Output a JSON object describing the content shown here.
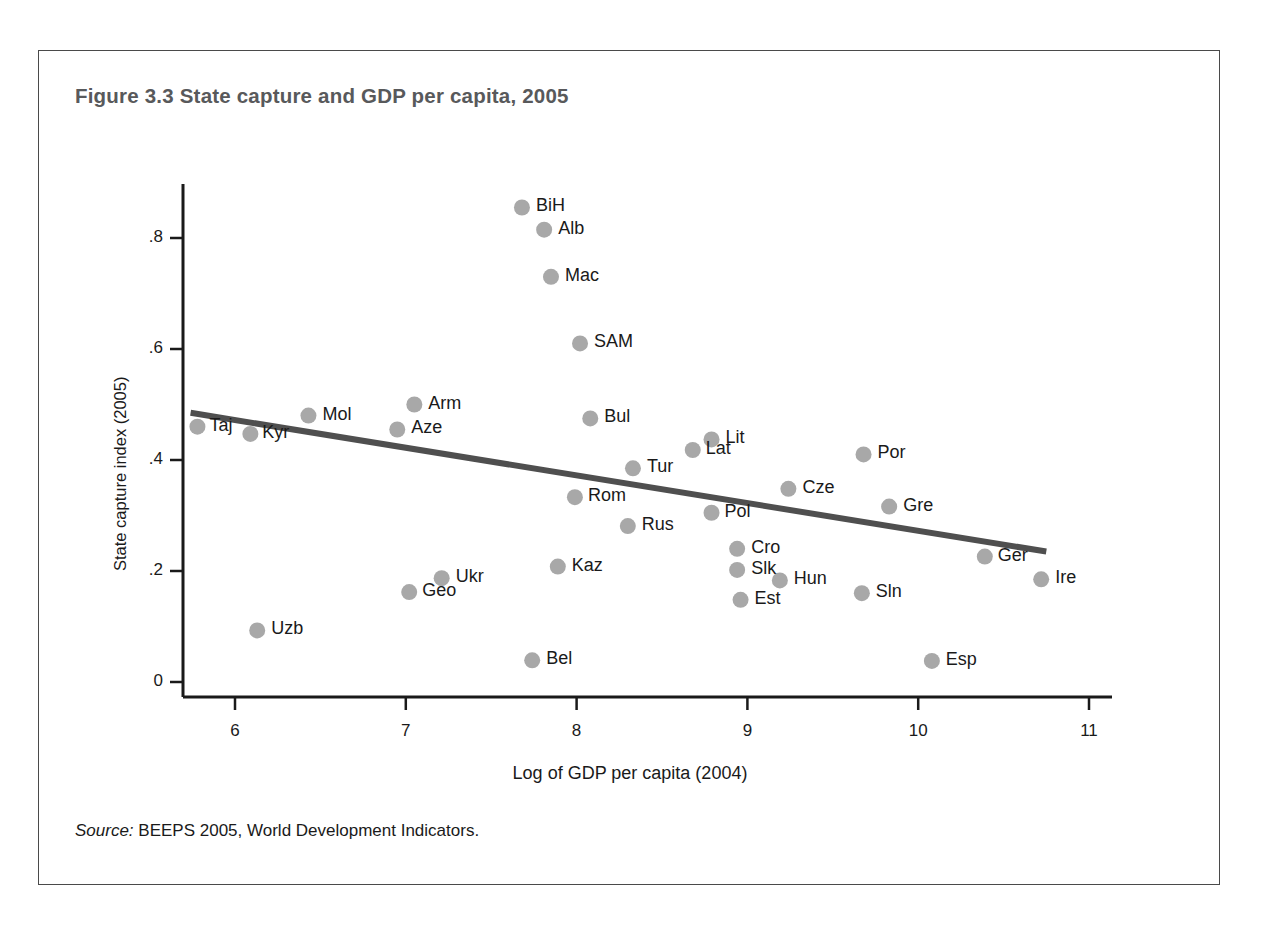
{
  "figure": {
    "title": "Figure 3.3  State capture and GDP per capita, 2005",
    "source_word": "Source:",
    "source_text": " BEEPS 2005, World Development Indicators."
  },
  "chart_data": {
    "type": "scatter",
    "title": "Figure 3.3  State capture and GDP per capita, 2005",
    "xlabel": "Log of GDP per capita (2004)",
    "ylabel": "State capture index (2005)",
    "xlim": [
      5.7,
      11.15
    ],
    "ylim": [
      -0.03,
      0.93
    ],
    "xticks": [
      6,
      7,
      8,
      9,
      10,
      11
    ],
    "xtick_labels": [
      "6",
      "7",
      "8",
      "9",
      "10",
      "11"
    ],
    "yticks": [
      0,
      0.2,
      0.4,
      0.6,
      0.8
    ],
    "ytick_labels": [
      "0",
      ".2",
      ".4",
      ".6",
      ".8"
    ],
    "grid": false,
    "legend": false,
    "marker_color": "#a8a8a8",
    "trendline_color": "#4f4f4f",
    "axis_color": "#1a1a1a",
    "trendline": {
      "x_start": 5.74,
      "y_start": 0.485,
      "x_end": 10.75,
      "y_end": 0.235
    },
    "points": [
      {
        "label": "BiH",
        "x": 7.68,
        "y": 0.855,
        "label_dx": 14,
        "label_dy": -9
      },
      {
        "label": "Alb",
        "x": 7.81,
        "y": 0.815,
        "label_dx": 14,
        "label_dy": -9
      },
      {
        "label": "Mac",
        "x": 7.85,
        "y": 0.73,
        "label_dx": 14,
        "label_dy": -9
      },
      {
        "label": "SAM",
        "x": 8.02,
        "y": 0.61,
        "label_dx": 14,
        "label_dy": -9
      },
      {
        "label": "Arm",
        "x": 7.05,
        "y": 0.5,
        "label_dx": 14,
        "label_dy": -9
      },
      {
        "label": "Mol",
        "x": 6.43,
        "y": 0.48,
        "label_dx": 14,
        "label_dy": -9
      },
      {
        "label": "Bul",
        "x": 8.08,
        "y": 0.475,
        "label_dx": 14,
        "label_dy": -9
      },
      {
        "label": "Taj",
        "x": 5.78,
        "y": 0.46,
        "label_dx": 12,
        "label_dy": -9
      },
      {
        "label": "Aze",
        "x": 6.95,
        "y": 0.455,
        "label_dx": 14,
        "label_dy": -9
      },
      {
        "label": "Kyr",
        "x": 6.09,
        "y": 0.447,
        "label_dx": 12,
        "label_dy": -9
      },
      {
        "label": "Lit",
        "x": 8.79,
        "y": 0.437,
        "label_dx": 14,
        "label_dy": -9
      },
      {
        "label": "Lat",
        "x": 8.68,
        "y": 0.418,
        "label_dx": 13,
        "label_dy": -9
      },
      {
        "label": "Por",
        "x": 9.68,
        "y": 0.41,
        "label_dx": 14,
        "label_dy": -9
      },
      {
        "label": "Tur",
        "x": 8.33,
        "y": 0.385,
        "label_dx": 14,
        "label_dy": -9
      },
      {
        "label": "Cze",
        "x": 9.24,
        "y": 0.348,
        "label_dx": 14,
        "label_dy": -9
      },
      {
        "label": "Rom",
        "x": 7.99,
        "y": 0.333,
        "label_dx": 13,
        "label_dy": -9
      },
      {
        "label": "Gre",
        "x": 9.83,
        "y": 0.316,
        "label_dx": 14,
        "label_dy": -9
      },
      {
        "label": "Pol",
        "x": 8.79,
        "y": 0.305,
        "label_dx": 13,
        "label_dy": -9
      },
      {
        "label": "Rus",
        "x": 8.3,
        "y": 0.281,
        "label_dx": 14,
        "label_dy": -9
      },
      {
        "label": "Cro",
        "x": 8.94,
        "y": 0.24,
        "label_dx": 14,
        "label_dy": -9
      },
      {
        "label": "Ger",
        "x": 10.39,
        "y": 0.226,
        "label_dx": 13,
        "label_dy": -9
      },
      {
        "label": "Kaz",
        "x": 7.89,
        "y": 0.208,
        "label_dx": 14,
        "label_dy": -9
      },
      {
        "label": "Slk",
        "x": 8.94,
        "y": 0.202,
        "label_dx": 14,
        "label_dy": -9
      },
      {
        "label": "Ire",
        "x": 10.72,
        "y": 0.185,
        "label_dx": 14,
        "label_dy": -9
      },
      {
        "label": "Ukr",
        "x": 7.21,
        "y": 0.187,
        "label_dx": 14,
        "label_dy": -9
      },
      {
        "label": "Hun",
        "x": 9.19,
        "y": 0.183,
        "label_dx": 14,
        "label_dy": -9
      },
      {
        "label": "Sln",
        "x": 9.67,
        "y": 0.16,
        "label_dx": 14,
        "label_dy": -9
      },
      {
        "label": "Geo",
        "x": 7.02,
        "y": 0.162,
        "label_dx": 13,
        "label_dy": -9
      },
      {
        "label": "Est",
        "x": 8.96,
        "y": 0.148,
        "label_dx": 14,
        "label_dy": -9
      },
      {
        "label": "Uzb",
        "x": 6.13,
        "y": 0.093,
        "label_dx": 14,
        "label_dy": -9
      },
      {
        "label": "Bel",
        "x": 7.74,
        "y": 0.039,
        "label_dx": 14,
        "label_dy": -9
      },
      {
        "label": "Esp",
        "x": 10.08,
        "y": 0.038,
        "label_dx": 14,
        "label_dy": -9
      }
    ]
  }
}
